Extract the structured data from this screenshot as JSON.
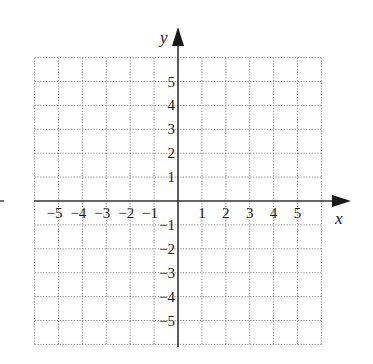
{
  "chart_data": {
    "type": "scatter",
    "title": "",
    "xlabel": "x",
    "ylabel": "y",
    "xlim": [
      -6,
      6
    ],
    "ylim": [
      -6,
      6
    ],
    "grid": true,
    "grid_style": "dotted",
    "x_ticks": [
      -5,
      -4,
      -3,
      -2,
      -1,
      1,
      2,
      3,
      4,
      5
    ],
    "y_ticks": [
      5,
      4,
      3,
      2,
      1,
      -1,
      -2,
      -3,
      -4,
      -5
    ],
    "x_tick_labels": [
      "−5",
      "−4",
      "−3",
      "−2",
      "−1",
      "1",
      "2",
      "3",
      "4",
      "5"
    ],
    "y_tick_labels": [
      "5",
      "4",
      "3",
      "2",
      "1",
      "−1",
      "−2",
      "−3",
      "−4",
      "−5"
    ],
    "series": [],
    "axis_color": "#333333",
    "grid_color": "#8a8a8a"
  },
  "labels": {
    "x_axis": "x",
    "y_axis": "y"
  }
}
